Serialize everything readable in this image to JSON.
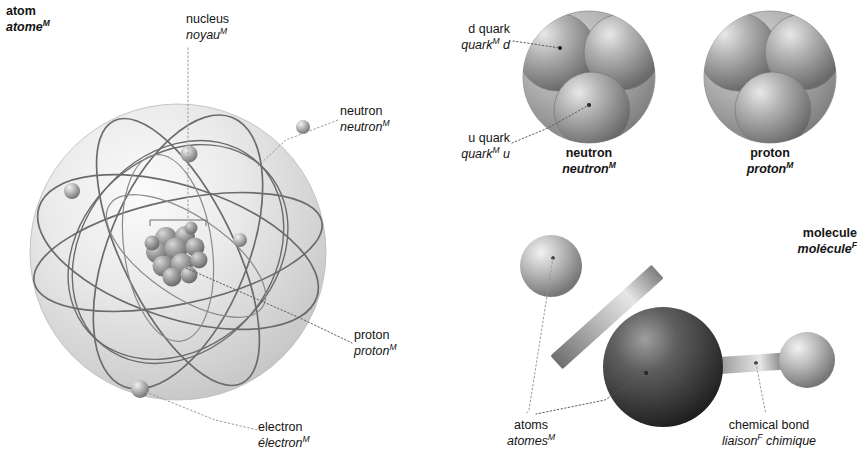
{
  "diagram": {
    "title_en": "atom",
    "title_fr": "atome",
    "language_pair": "English / French",
    "accent_color": "#9a9a9a",
    "background": "#ffffff"
  },
  "labels": {
    "atom": {
      "en": "atom",
      "fr": "atome",
      "gender": "M",
      "bold": true
    },
    "nucleus": {
      "en": "nucleus",
      "fr": "noyau",
      "gender": "M",
      "bold": false
    },
    "neutron_atom": {
      "en": "neutron",
      "fr": "neutron",
      "gender": "M",
      "bold": false
    },
    "proton_atom": {
      "en": "proton",
      "fr": "proton",
      "gender": "M",
      "bold": false
    },
    "electron": {
      "en": "electron",
      "fr": "électron",
      "gender": "M",
      "bold": false
    },
    "d_quark": {
      "en": "d quark",
      "fr": "quark",
      "fr_suffix": " d",
      "gender": "M",
      "bold": false
    },
    "u_quark": {
      "en": "u quark",
      "fr": "quark",
      "fr_suffix": " u",
      "gender": "M",
      "bold": false
    },
    "neutron_title": {
      "en": "neutron",
      "fr": "neutron",
      "gender": "M",
      "bold": true
    },
    "proton_title": {
      "en": "proton",
      "fr": "proton",
      "gender": "M",
      "bold": true
    },
    "molecule": {
      "en": "molecule",
      "fr": "molécule",
      "gender": "F",
      "bold": true
    },
    "atoms": {
      "en": "atoms",
      "fr": "atomes",
      "gender": "M",
      "bold": false
    },
    "chemical_bond": {
      "en": "chemical bond",
      "fr": "liaison",
      "fr_suffix": " chimique",
      "gender": "F",
      "bold": false
    }
  },
  "figures": {
    "atom": {
      "name": "atom-sphere",
      "center": [
        178,
        252
      ],
      "radius": 148,
      "orbital_count": 7,
      "electron_count": 6,
      "nucleus_particles": 12
    },
    "neutron": {
      "name": "neutron-particle",
      "center": [
        589,
        77
      ],
      "radius": 66,
      "quarks": [
        "d",
        "d",
        "u"
      ]
    },
    "proton": {
      "name": "proton-particle",
      "center": [
        770,
        77
      ],
      "radius": 66,
      "quarks": [
        "u",
        "u",
        "d"
      ]
    },
    "molecule": {
      "name": "molecule-model",
      "central_atom": [
        663,
        367
      ],
      "central_radius": 60,
      "outer_atoms": [
        [
          551,
          266
        ],
        [
          807,
          360
        ]
      ],
      "outer_radius": [
        31,
        28
      ],
      "bond_count": 2
    }
  }
}
